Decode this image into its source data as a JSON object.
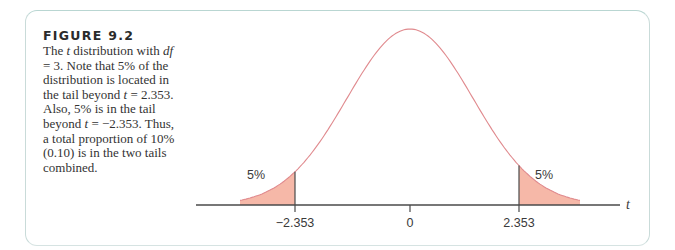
{
  "figure": {
    "title": "FIGURE 9.2",
    "caption_parts": [
      {
        "text": "The ",
        "italic": false
      },
      {
        "text": "t",
        "italic": true
      },
      {
        "text": " distribution with ",
        "italic": false
      },
      {
        "text": "df",
        "italic": true
      },
      {
        "text": " = 3. Note that 5% of the distribution is located in the tail beyond ",
        "italic": false
      },
      {
        "text": "t",
        "italic": true
      },
      {
        "text": " = 2.353. Also, 5% is in the tail beyond ",
        "italic": false
      },
      {
        "text": "t",
        "italic": true
      },
      {
        "text": " = −2.353. Thus, a total proportion of 10% (0.10) is in the two tails combined.",
        "italic": false
      }
    ]
  },
  "colors": {
    "curve": "#e08a8e",
    "tail_fill": "#f6b8a8",
    "axis": "#4a4a4a",
    "frame": "#c9dbd9"
  },
  "chart_data": {
    "type": "area",
    "title": "The t distribution with df = 3",
    "distribution": "t",
    "df": 3,
    "xlabel": "t",
    "ylabel": "",
    "x_ticks": [
      -2.353,
      0,
      2.353
    ],
    "x_tick_labels": [
      "−2.353",
      "0",
      "2.353"
    ],
    "shaded_regions": [
      {
        "name": "left tail",
        "from": null,
        "to": -2.353,
        "area": 0.05,
        "label": "5%"
      },
      {
        "name": "right tail",
        "from": 2.353,
        "to": null,
        "area": 0.05,
        "label": "5%"
      }
    ],
    "total_tail_proportion": 0.1,
    "grid": false,
    "legend": "none"
  }
}
